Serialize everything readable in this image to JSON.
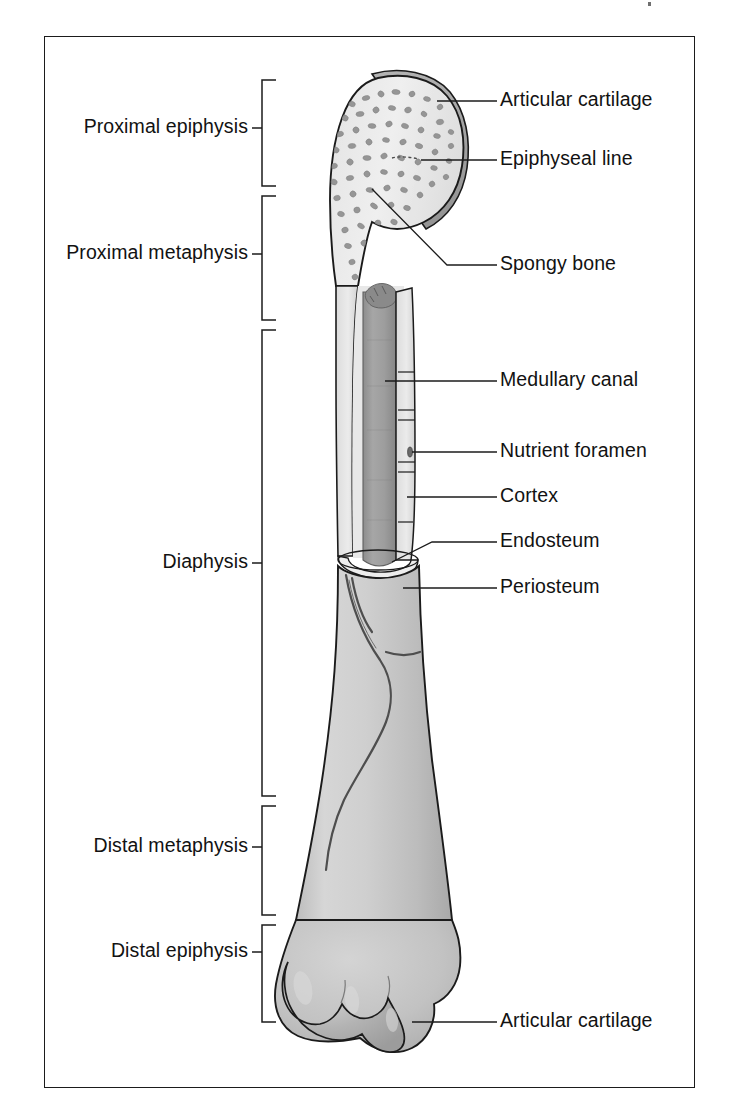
{
  "figure": {
    "type": "anatomical-diagram",
    "frame": {
      "border_color": "#1b1b1b"
    },
    "palette": {
      "background": "#ffffff",
      "ink": "#121212",
      "cortex_light": "#e9e9e9",
      "bone_body": "#c9c9c9",
      "cartilage_gray": "#a8a8a8",
      "marrow_gray": "#9b9b9b",
      "trabecula_gray": "#8f8f8f",
      "vessel_gray": "#5a5a5a"
    }
  },
  "bracket_labels": [
    {
      "id": "proximal-epiphysis",
      "text": "Proximal epiphysis",
      "text_x": 228,
      "text_y": 128,
      "bracket_top": 80,
      "bracket_bottom": 186,
      "bracket_x": 262,
      "tick_y": 128
    },
    {
      "id": "proximal-metaphysis",
      "text": "Proximal metaphysis",
      "text_x": 228,
      "text_y": 254,
      "bracket_top": 196,
      "bracket_bottom": 320,
      "bracket_x": 262,
      "tick_y": 254
    },
    {
      "id": "diaphysis",
      "text": "Diaphysis",
      "text_x": 228,
      "text_y": 563,
      "bracket_top": 330,
      "bracket_bottom": 796,
      "bracket_x": 262,
      "tick_y": 563
    },
    {
      "id": "distal-metaphysis",
      "text": "Distal metaphysis",
      "text_x": 228,
      "text_y": 847,
      "bracket_top": 806,
      "bracket_bottom": 915,
      "bracket_x": 262,
      "tick_y": 847
    },
    {
      "id": "distal-epiphysis",
      "text": "Distal epiphysis",
      "text_x": 228,
      "text_y": 952,
      "bracket_top": 925,
      "bracket_bottom": 1022,
      "bracket_x": 262,
      "tick_y": 952
    }
  ],
  "leader_labels": [
    {
      "id": "articular-cartilage-proximal",
      "text": "Articular cartilage",
      "text_x": 500,
      "text_y": 101,
      "line": [
        [
          497,
          101
        ],
        [
          437,
          101
        ]
      ]
    },
    {
      "id": "epiphyseal-line",
      "text": "Epiphyseal line",
      "text_x": 500,
      "text_y": 160,
      "line": [
        [
          497,
          160
        ],
        [
          421,
          160
        ]
      ]
    },
    {
      "id": "spongy-bone",
      "text": "Spongy bone",
      "text_x": 500,
      "text_y": 265,
      "line": [
        [
          497,
          265
        ],
        [
          447,
          265
        ],
        [
          372,
          189
        ]
      ]
    },
    {
      "id": "medullary-canal",
      "text": "Medullary canal",
      "text_x": 500,
      "text_y": 381,
      "line": [
        [
          497,
          381
        ],
        [
          385,
          381
        ]
      ]
    },
    {
      "id": "nutrient-foramen",
      "text": "Nutrient foramen",
      "text_x": 500,
      "text_y": 452,
      "line": [
        [
          497,
          452
        ],
        [
          412,
          452
        ]
      ]
    },
    {
      "id": "cortex",
      "text": "Cortex",
      "text_x": 500,
      "text_y": 497,
      "line": [
        [
          497,
          497
        ],
        [
          407,
          497
        ]
      ]
    },
    {
      "id": "endosteum",
      "text": "Endosteum",
      "text_x": 500,
      "text_y": 542,
      "line": [
        [
          497,
          542
        ],
        [
          432,
          542
        ],
        [
          392,
          562
        ]
      ]
    },
    {
      "id": "periosteum",
      "text": "Periosteum",
      "text_x": 500,
      "text_y": 588,
      "line": [
        [
          497,
          588
        ],
        [
          403,
          588
        ]
      ]
    },
    {
      "id": "articular-cartilage-distal",
      "text": "Articular cartilage",
      "text_x": 500,
      "text_y": 1022,
      "line": [
        [
          497,
          1022
        ],
        [
          412,
          1022
        ]
      ]
    }
  ]
}
